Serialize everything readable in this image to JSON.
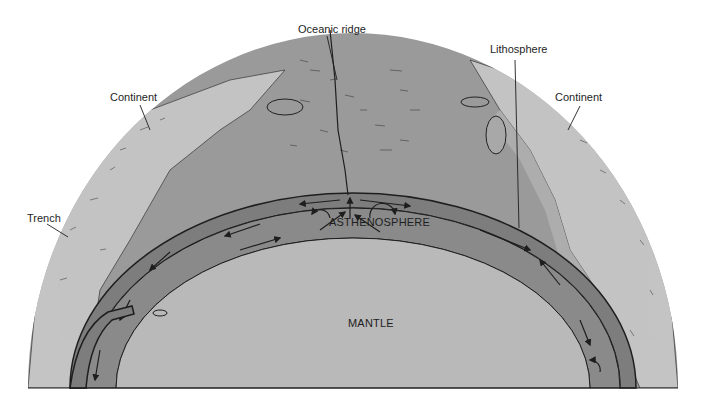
{
  "diagram": {
    "labels": {
      "oceanic_ridge": "Oceanic ridge",
      "lithosphere": "Lithosphere",
      "continent_left": "Continent",
      "continent_right": "Continent",
      "trench": "Trench",
      "asthenosphere": "ASTHENOSPHERE",
      "mantle": "MANTLE"
    },
    "colors": {
      "background": "#ffffff",
      "surface_ocean": "#9a9a9a",
      "continent": "#c4c4c4",
      "lithosphere_band": "#7d7d7d",
      "asthenosphere_band": "#8a8a8a",
      "mantle": "#b9b9b9",
      "ink": "#1e1e1e"
    }
  }
}
